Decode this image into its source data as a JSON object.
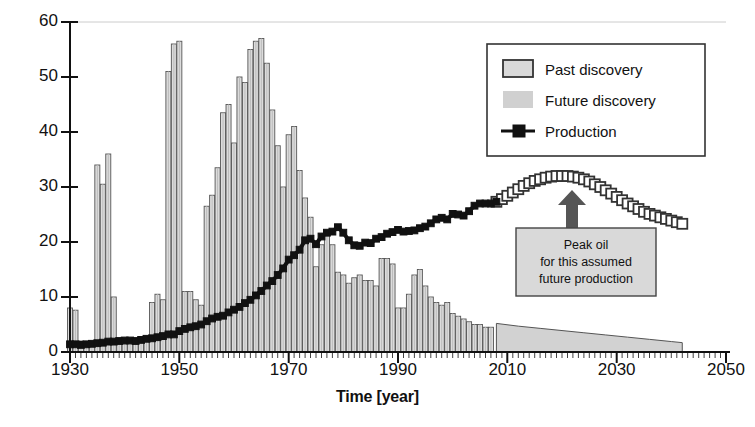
{
  "chart_data": {
    "type": "bar",
    "title": "",
    "xlabel": "Time [year]",
    "ylabel": "Billion barrels of oil per year [Gb/a]",
    "xlim": [
      1930,
      2050
    ],
    "ylim": [
      0,
      60
    ],
    "xticks": [
      1930,
      1950,
      1970,
      1990,
      2010,
      2030,
      2050
    ],
    "xtick_labels": [
      "1930",
      "1950",
      "1970",
      "1990",
      "2010",
      "2030",
      "2050"
    ],
    "yticks": [
      0,
      10,
      20,
      30,
      40,
      50,
      60
    ],
    "ytick_labels": [
      "0",
      "10",
      "20",
      "30",
      "40",
      "50",
      "60"
    ],
    "minor_xtick_interval": 1,
    "grid": false,
    "legend_position": "upper right",
    "legend": [
      {
        "label": "Past discovery",
        "marker": "open-rectangle",
        "fill": "#d9d9d9",
        "edge": "#333333"
      },
      {
        "label": "Future discovery",
        "marker": "filled-rectangle",
        "fill": "#d0d0d0",
        "edge": "none"
      },
      {
        "label": "Production",
        "marker": "filled-square-line",
        "fill": "#111111",
        "edge": "#111111"
      }
    ],
    "annotation": {
      "lines": [
        "Peak oil",
        "for this assumed",
        "future production"
      ],
      "box_fill": "#d9d9d9",
      "box_edge": "#444444",
      "arrow_color": "#555555",
      "points_to_year": 2020,
      "points_to_value": 32
    },
    "series": [
      {
        "name": "Past discovery",
        "type": "bar",
        "x": [
          1930,
          1931,
          1932,
          1933,
          1934,
          1935,
          1936,
          1937,
          1938,
          1939,
          1940,
          1941,
          1942,
          1943,
          1944,
          1945,
          1946,
          1947,
          1948,
          1949,
          1950,
          1951,
          1952,
          1953,
          1954,
          1955,
          1956,
          1957,
          1958,
          1959,
          1960,
          1961,
          1962,
          1963,
          1964,
          1965,
          1966,
          1967,
          1968,
          1969,
          1970,
          1971,
          1972,
          1973,
          1974,
          1975,
          1976,
          1977,
          1978,
          1979,
          1980,
          1981,
          1982,
          1983,
          1984,
          1985,
          1986,
          1987,
          1988,
          1989,
          1990,
          1991,
          1992,
          1993,
          1994,
          1995,
          1996,
          1997,
          1998,
          1999,
          2000,
          2001,
          2002,
          2003,
          2004,
          2005,
          2006,
          2007
        ],
        "values": [
          8.0,
          7.6,
          2.0,
          1.6,
          1.5,
          34.0,
          30.5,
          36.0,
          10.0,
          2.0,
          1.5,
          2.0,
          2.0,
          2.0,
          2.0,
          9.0,
          10.5,
          9.5,
          51.0,
          56.0,
          56.5,
          11.0,
          11.0,
          9.5,
          8.5,
          26.5,
          28.5,
          33.5,
          43.5,
          45.0,
          38.0,
          50.0,
          49.0,
          55.0,
          56.5,
          57.0,
          52.5,
          44.0,
          37.5,
          30.0,
          39.5,
          41.0,
          33.0,
          28.0,
          24.5,
          15.5,
          19.5,
          21.5,
          19.5,
          14.5,
          14.0,
          12.5,
          13.5,
          14.0,
          13.0,
          13.0,
          12.0,
          17.0,
          17.0,
          16.0,
          8.0,
          8.0,
          10.5,
          14.0,
          15.0,
          12.0,
          10.0,
          9.0,
          8.5,
          9.0,
          7.0,
          6.5,
          6.0,
          5.5,
          5.0,
          5.0,
          4.5,
          4.5
        ]
      },
      {
        "name": "Future discovery",
        "type": "area",
        "x": [
          2008,
          2012,
          2016,
          2020,
          2024,
          2028,
          2032,
          2036,
          2040,
          2042
        ],
        "values": [
          5.2,
          4.7,
          4.3,
          3.9,
          3.5,
          3.1,
          2.7,
          2.3,
          1.9,
          1.7
        ]
      },
      {
        "name": "Production (past)",
        "type": "line",
        "marker": "filled-square",
        "x": [
          1930,
          1931,
          1932,
          1933,
          1934,
          1935,
          1936,
          1937,
          1938,
          1939,
          1940,
          1941,
          1942,
          1943,
          1944,
          1945,
          1946,
          1947,
          1948,
          1949,
          1950,
          1951,
          1952,
          1953,
          1954,
          1955,
          1956,
          1957,
          1958,
          1959,
          1960,
          1961,
          1962,
          1963,
          1964,
          1965,
          1966,
          1967,
          1968,
          1969,
          1970,
          1971,
          1972,
          1973,
          1974,
          1975,
          1976,
          1977,
          1978,
          1979,
          1980,
          1981,
          1982,
          1983,
          1984,
          1985,
          1986,
          1987,
          1988,
          1989,
          1990,
          1991,
          1992,
          1993,
          1994,
          1995,
          1996,
          1997,
          1998,
          1999,
          2000,
          2001,
          2002,
          2003,
          2004,
          2005,
          2006,
          2007,
          2008
        ],
        "values": [
          1.4,
          1.4,
          1.3,
          1.4,
          1.5,
          1.6,
          1.7,
          1.9,
          1.9,
          2.0,
          2.1,
          2.1,
          2.0,
          2.2,
          2.4,
          2.5,
          2.7,
          2.9,
          3.2,
          3.2,
          3.8,
          4.2,
          4.5,
          4.7,
          5.0,
          5.6,
          6.1,
          6.4,
          6.6,
          7.2,
          7.7,
          8.2,
          8.9,
          9.5,
          10.3,
          11.1,
          12.1,
          12.9,
          14.0,
          15.2,
          16.8,
          17.6,
          18.6,
          20.3,
          20.6,
          19.6,
          21.0,
          21.7,
          21.9,
          22.7,
          21.7,
          20.3,
          19.4,
          19.3,
          19.9,
          19.8,
          20.6,
          20.9,
          21.5,
          21.8,
          22.2,
          21.9,
          22.0,
          22.1,
          22.5,
          22.8,
          23.4,
          24.1,
          24.4,
          24.1,
          25.1,
          25.0,
          24.8,
          25.6,
          26.6,
          27.0,
          27.0,
          27.0,
          27.3
        ]
      },
      {
        "name": "Production (future)",
        "type": "line",
        "marker": "open-square",
        "x": [
          2008,
          2009,
          2010,
          2011,
          2012,
          2013,
          2014,
          2015,
          2016,
          2017,
          2018,
          2019,
          2020,
          2021,
          2022,
          2023,
          2024,
          2025,
          2026,
          2027,
          2028,
          2029,
          2030,
          2031,
          2032,
          2033,
          2034,
          2035,
          2036,
          2037,
          2038,
          2039,
          2040,
          2041,
          2042
        ],
        "values": [
          27.3,
          27.8,
          28.4,
          29.0,
          29.6,
          30.2,
          30.7,
          31.1,
          31.4,
          31.7,
          31.9,
          32.0,
          32.0,
          32.0,
          31.9,
          31.7,
          31.4,
          31.0,
          30.5,
          30.0,
          29.4,
          28.8,
          28.2,
          27.6,
          27.0,
          26.5,
          26.0,
          25.5,
          25.1,
          24.8,
          24.5,
          24.2,
          23.9,
          23.6,
          23.3
        ]
      }
    ]
  }
}
